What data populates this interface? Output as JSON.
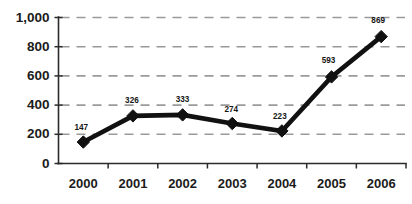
{
  "chart_data": {
    "type": "line",
    "title": "",
    "subtitle": "",
    "xlabel": "",
    "ylabel": "",
    "categories": [
      "2000",
      "2001",
      "2002",
      "2003",
      "2004",
      "2005",
      "2006"
    ],
    "values": [
      147,
      326,
      333,
      274,
      223,
      593,
      869
    ],
    "point_labels": [
      "147",
      "326",
      "333",
      "274",
      "223",
      "593",
      "869"
    ],
    "ylim": [
      0,
      1000
    ],
    "yticks": [
      0,
      200,
      400,
      600,
      800,
      1000
    ],
    "ytick_labels": [
      "0",
      "200",
      "400",
      "600",
      "800",
      "1,000"
    ],
    "grid": true,
    "grid_axis": "y",
    "grid_style": "dashed",
    "legend": false,
    "legend_position": "none",
    "marker": "diamond",
    "series": [
      {
        "name": "",
        "values": [
          147,
          326,
          333,
          274,
          223,
          593,
          869
        ]
      }
    ],
    "colors": {
      "line": "#111111",
      "marker": "#111111",
      "grid": "#9a9a9a",
      "axis": "#2b2b2b",
      "text": "#1b1b1b",
      "background": "#ffffff"
    }
  }
}
